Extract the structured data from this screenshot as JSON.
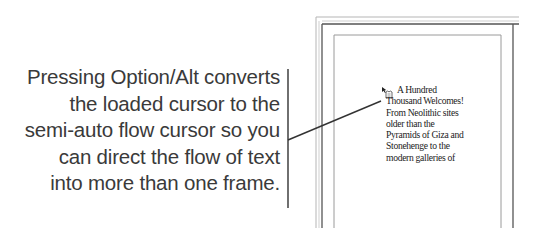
{
  "callout": {
    "lines": [
      "Pressing Option/Alt converts",
      "the loaded cursor to the",
      "semi-auto flow cursor so you",
      "can direct the flow of text",
      "into more than one frame."
    ]
  },
  "page_frame": {
    "text_lines": [
      "A Hundred",
      "Thousand Welcomes!",
      "From Neolithic sites",
      "older than the",
      "Pyramids of Giza and",
      "Stonehenge to the",
      "modern galleries of"
    ],
    "cursor": "semi-auto-flow-cursor-icon"
  }
}
